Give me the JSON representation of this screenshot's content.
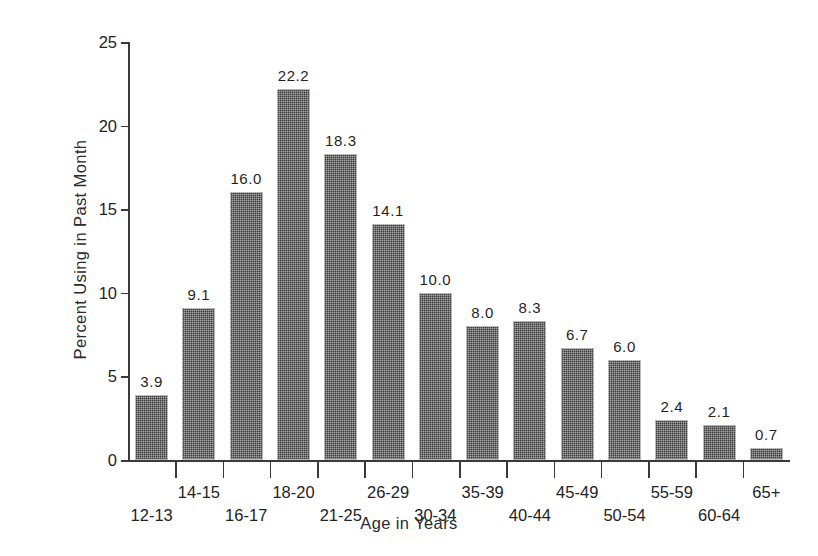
{
  "chart_data": {
    "type": "bar",
    "title": "",
    "xlabel": "Age in Years",
    "ylabel": "Percent Using in Past Month",
    "categories": [
      "12-13",
      "14-15",
      "16-17",
      "18-20",
      "21-25",
      "26-29",
      "30-34",
      "35-39",
      "40-44",
      "45-49",
      "50-54",
      "55-59",
      "60-64",
      "65+"
    ],
    "values": [
      3.9,
      9.1,
      16.0,
      22.2,
      18.3,
      14.1,
      10.0,
      8.0,
      8.3,
      6.7,
      6.0,
      2.4,
      2.1,
      0.7
    ],
    "value_labels": [
      "3.9",
      "9.1",
      "16.0",
      "22.2",
      "18.3",
      "14.1",
      "10.0",
      "8.0",
      "8.3",
      "6.7",
      "6.0",
      "2.4",
      "2.1",
      "0.7"
    ],
    "ylim": [
      0,
      25
    ],
    "yticks": [
      0,
      5,
      10,
      15,
      20,
      25
    ],
    "ytick_labels": [
      "0",
      "5",
      "10",
      "15",
      "20",
      "25"
    ],
    "xlim": [
      0,
      14
    ],
    "grid": false,
    "legend": false,
    "legend_position": "none",
    "bar_fill_color": "#3b3b3b",
    "bar_edge_color": "#b9b9b9",
    "axis_color": "#3a3a3a",
    "text_color": "#232323",
    "background_color": "#ffffff",
    "label_stagger": [
      "bottom",
      "top",
      "bottom",
      "top",
      "bottom",
      "top",
      "bottom",
      "top",
      "bottom",
      "top",
      "bottom",
      "top",
      "bottom",
      "top"
    ]
  }
}
